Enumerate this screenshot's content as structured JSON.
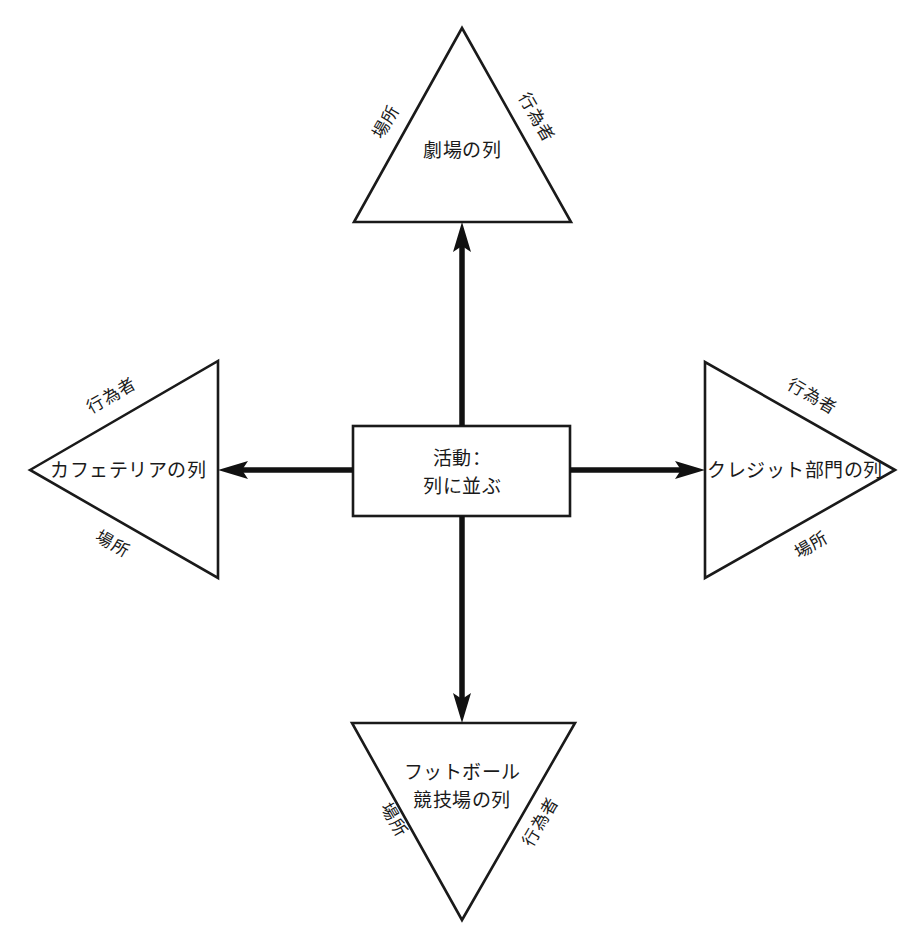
{
  "diagram": {
    "type": "radial-relationship-diagram",
    "background_color": "#ffffff",
    "line_color": "#1a1a1a",
    "center": {
      "shape": "rectangle",
      "line1": "活動：",
      "line2": "列に並ぶ"
    },
    "nodes": [
      {
        "id": "theater",
        "position": "top",
        "shape": "triangle-up",
        "label_line1": "劇場の列",
        "label_line2": "",
        "edge_label_left": "場所",
        "edge_label_right": "行為者"
      },
      {
        "id": "cafeteria",
        "position": "left",
        "shape": "triangle-left",
        "label_line1": "カフェテリアの列",
        "label_line2": "",
        "edge_label_top": "行為者",
        "edge_label_bottom": "場所"
      },
      {
        "id": "credit-department",
        "position": "right",
        "shape": "triangle-right",
        "label_line1": "クレジット部門の列",
        "label_line2": "",
        "edge_label_top": "行為者",
        "edge_label_bottom": "場所"
      },
      {
        "id": "football-stadium",
        "position": "bottom",
        "shape": "triangle-down",
        "label_line1": "フットボール",
        "label_line2": "競技場の列",
        "edge_label_left": "場所",
        "edge_label_right": "行為者"
      }
    ],
    "connectors": [
      {
        "id": "center-to-theater",
        "direction": "up"
      },
      {
        "id": "center-to-cafeteria",
        "direction": "left"
      },
      {
        "id": "center-to-credit-department",
        "direction": "right"
      },
      {
        "id": "center-to-football-stadium",
        "direction": "down"
      }
    ]
  }
}
